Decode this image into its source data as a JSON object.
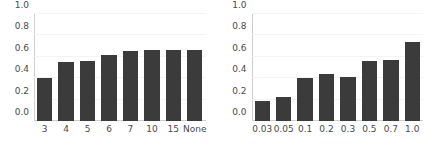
{
  "figure": {
    "background": "#ffffff",
    "bar_color": "#3b3b3b",
    "grid_color": "#f4f4f4",
    "axis_color": "#cfcfcf",
    "tick_label_color": "#4a4a4a"
  },
  "chart_data": [
    {
      "type": "bar",
      "title": "",
      "xlabel": "",
      "ylabel": "",
      "categories": [
        "3",
        "4",
        "5",
        "6",
        "7",
        "10",
        "15",
        "None"
      ],
      "values": [
        0.4,
        0.55,
        0.56,
        0.62,
        0.65,
        0.665,
        0.665,
        0.665
      ],
      "ylim": [
        0.0,
        1.0
      ],
      "yticks": [
        "1.0",
        "0.8",
        "0.6",
        "0.4",
        "0.2",
        "0.0"
      ],
      "ytick_values": [
        1.0,
        0.8,
        0.6,
        0.4,
        0.2,
        0.0
      ],
      "grid": true,
      "legend": null
    },
    {
      "type": "bar",
      "title": "",
      "xlabel": "",
      "ylabel": "",
      "categories": [
        "0.03",
        "0.05",
        "0.1",
        "0.2",
        "0.3",
        "0.5",
        "0.7",
        "1.0"
      ],
      "values": [
        0.19,
        0.22,
        0.4,
        0.44,
        0.41,
        0.56,
        0.57,
        0.74
      ],
      "ylim": [
        0.0,
        1.0
      ],
      "yticks": [
        "1.0",
        "0.8",
        "0.6",
        "0.4",
        "0.2",
        "0.0"
      ],
      "ytick_values": [
        1.0,
        0.8,
        0.6,
        0.4,
        0.2,
        0.0
      ],
      "grid": true,
      "legend": null
    }
  ]
}
